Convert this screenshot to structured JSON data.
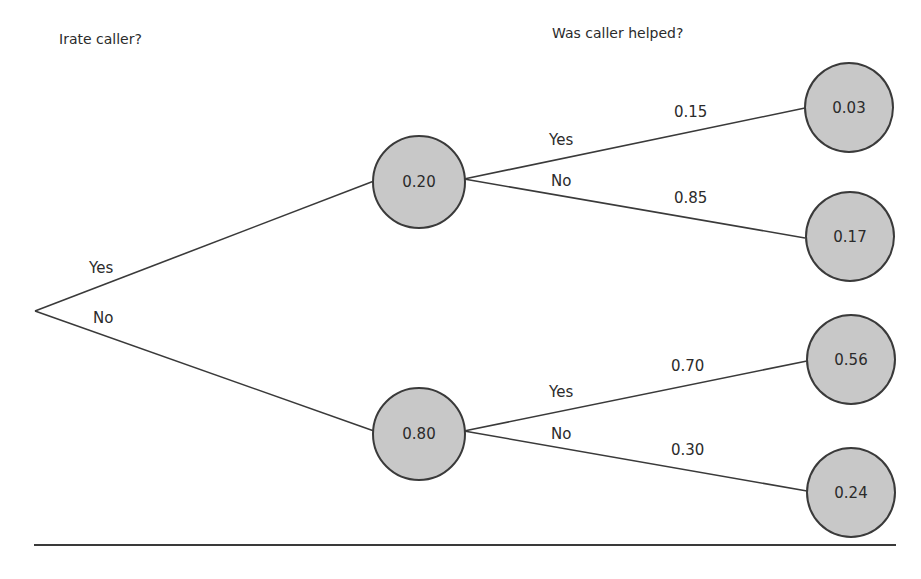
{
  "headings": {
    "stage1": "Irate caller?",
    "stage2": "Was caller helped?"
  },
  "root": {
    "branches": [
      {
        "label": "Yes",
        "to": "irate_yes"
      },
      {
        "label": "No",
        "to": "irate_no"
      }
    ]
  },
  "nodes": {
    "irate_yes": {
      "value": "0.20"
    },
    "irate_no": {
      "value": "0.80"
    }
  },
  "subbranches": {
    "irate_yes": [
      {
        "label": "Yes",
        "probability": "0.15",
        "leaf": "0.03"
      },
      {
        "label": "No",
        "probability": "0.85",
        "leaf": "0.17"
      }
    ],
    "irate_no": [
      {
        "label": "Yes",
        "probability": "0.70",
        "leaf": "0.56"
      },
      {
        "label": "No",
        "probability": "0.30",
        "leaf": "0.24"
      }
    ]
  },
  "colors": {
    "node_fill": "#c8c8c8",
    "node_stroke": "#3a3a3a",
    "line": "#3a3a3a",
    "text": "#2b2b2b"
  }
}
